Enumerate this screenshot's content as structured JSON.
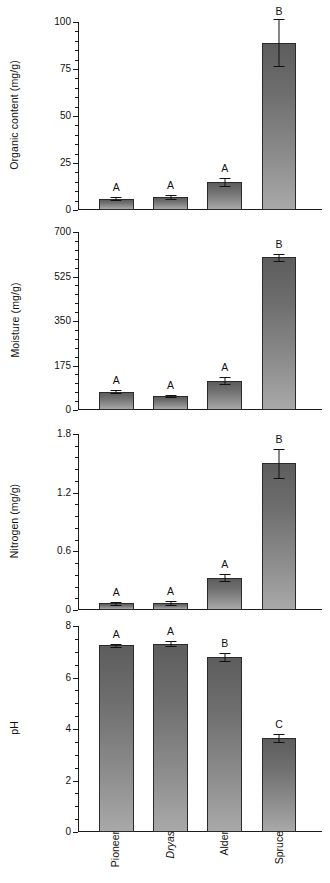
{
  "figure": {
    "categories": [
      "Pioneer",
      "Dryas",
      "Alder",
      "Spruce"
    ],
    "category_styles": [
      "normal",
      "italic",
      "normal",
      "normal"
    ]
  },
  "chart_data": [
    {
      "type": "bar",
      "title": "",
      "xlabel": "",
      "ylabel": "Organic content (mg/g)",
      "categories": [
        "Pioneer",
        "Dryas",
        "Alder",
        "Spruce"
      ],
      "values": [
        6.0,
        7.0,
        15.0,
        89.0
      ],
      "errors": [
        0.8,
        1.2,
        2.0,
        12.5
      ],
      "significance": [
        "A",
        "A",
        "A",
        "B"
      ],
      "ylim": [
        0,
        100
      ],
      "yticks": [
        0,
        25,
        50,
        75,
        100
      ],
      "yticklabels": [
        "0",
        "25",
        "50",
        "75",
        "100"
      ],
      "grid": false,
      "legend": "none"
    },
    {
      "type": "bar",
      "title": "",
      "xlabel": "",
      "ylabel": "Moisture (mg/g)",
      "categories": [
        "Pioneer",
        "Dryas",
        "Alder",
        "Spruce"
      ],
      "values": [
        72,
        55,
        115,
        600
      ],
      "errors": [
        5,
        4,
        13,
        15
      ],
      "significance": [
        "A",
        "A",
        "A",
        "B"
      ],
      "ylim": [
        0,
        700
      ],
      "yticks": [
        0,
        175,
        350,
        525,
        700
      ],
      "yticklabels": [
        "0",
        "175",
        "350",
        "525",
        "700"
      ],
      "grid": false,
      "legend": "none"
    },
    {
      "type": "bar",
      "title": "",
      "xlabel": "",
      "ylabel": "Nitrogen (mg/g)",
      "categories": [
        "Pioneer",
        "Dryas",
        "Alder",
        "Spruce"
      ],
      "values": [
        0.07,
        0.07,
        0.33,
        1.5
      ],
      "errors": [
        0.015,
        0.02,
        0.035,
        0.15
      ],
      "significance": [
        "A",
        "A",
        "A",
        "B"
      ],
      "ylim": [
        0,
        1.8
      ],
      "yticks": [
        0,
        0.6,
        1.2,
        1.8
      ],
      "yticklabels": [
        "0",
        "0.6",
        "1.2",
        "1.8"
      ],
      "grid": false,
      "legend": "none"
    },
    {
      "type": "bar",
      "title": "",
      "xlabel": "",
      "ylabel": "pH",
      "categories": [
        "Pioneer",
        "Dryas",
        "Alder",
        "Spruce"
      ],
      "values": [
        7.25,
        7.32,
        6.8,
        3.65
      ],
      "errors": [
        0.07,
        0.08,
        0.17,
        0.15
      ],
      "significance": [
        "A",
        "A",
        "B",
        "C"
      ],
      "ylim": [
        0,
        8
      ],
      "yticks": [
        0,
        2,
        4,
        6,
        8
      ],
      "yticklabels": [
        "0",
        "2",
        "4",
        "6",
        "8"
      ],
      "grid": false,
      "legend": "none"
    }
  ]
}
